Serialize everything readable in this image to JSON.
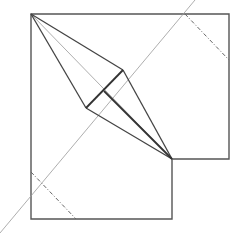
{
  "diagram": {
    "type": "origami-crease-pattern",
    "width": 245,
    "height": 241,
    "colors": {
      "outline": "#555555",
      "fold": "#444444",
      "thin": "#999999",
      "dashdot": "#666666",
      "background": "#ffffff"
    },
    "outline_points": "31,14 229,14 229,159 172,159 172,219 31,219",
    "kite": {
      "apex": [
        31,
        14
      ],
      "right": [
        123,
        70
      ],
      "center": [
        104,
        91
      ],
      "left": [
        86,
        108
      ],
      "tip": [
        172,
        159
      ]
    },
    "diagonal_line": {
      "x1": 0,
      "y1": 233,
      "x2": 195,
      "y2": 0
    },
    "center_diagonal": {
      "x1": 31,
      "y1": 14,
      "x2": 172,
      "y2": 159
    },
    "dashdot_lines": [
      {
        "x1": 185,
        "y1": 14,
        "x2": 229,
        "y2": 60
      },
      {
        "x1": 31,
        "y1": 172,
        "x2": 76,
        "y2": 219
      }
    ]
  }
}
